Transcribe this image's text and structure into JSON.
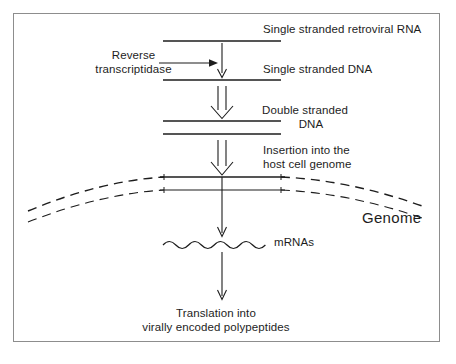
{
  "figure": {
    "border_color": "#8d8d8d",
    "ink_color": "#1d1d1d",
    "background": "#ffffff"
  },
  "labels": {
    "retroviral_rna": "Single stranded retroviral RNA",
    "reverse_transcriptase_line1": "Reverse",
    "reverse_transcriptase_line2": "transcriptidase",
    "single_stranded_dna": "Single stranded DNA",
    "double_stranded_dna_line1": "Double stranded",
    "double_stranded_dna_line2": "DNA",
    "insertion_line1": "Insertion into the",
    "insertion_line2": "host cell genome",
    "genome": "Genome",
    "mrnas": "mRNAs",
    "translation_line1": "Translation into",
    "translation_line2": "virally encoded polypeptides"
  },
  "diagram_elements": {
    "rna_strand": "single horizontal line",
    "ssdna_strand": "single horizontal line",
    "dsdna_strands": "two parallel horizontal lines",
    "host_genome": "two long curved arcs with dashed ends",
    "mrna": "wavy horizontal line",
    "arrow_thin_enzyme": "rightward thin arrow",
    "arrow_thin_transcription": "downward thin arrow",
    "arrow_thin_translation": "downward thin arrow",
    "arrow_hollow_synthesis": "downward hollow outline arrow",
    "arrow_hollow_insertion": "downward hollow outline arrow"
  }
}
